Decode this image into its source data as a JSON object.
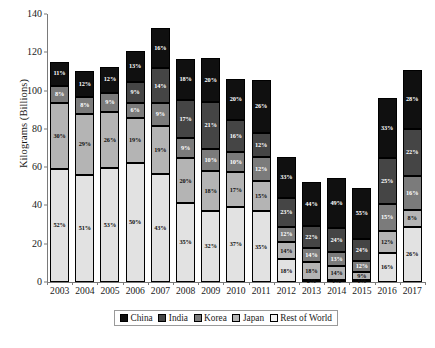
{
  "chart_data": {
    "type": "bar",
    "subtype": "stacked-bar-percent-labels",
    "title": "",
    "xlabel": "",
    "ylabel": "Kilograms (Billions)",
    "ylim": [
      0,
      140
    ],
    "yticks": [
      0,
      20,
      40,
      60,
      80,
      100,
      120,
      140
    ],
    "grid": false,
    "legend_position": "bottom",
    "categories": [
      "2003",
      "2004",
      "2005",
      "2006",
      "2007",
      "2008",
      "2009",
      "2010",
      "2011",
      "2012",
      "2013",
      "2014",
      "2015",
      "2016",
      "2017"
    ],
    "totals": [
      114,
      110,
      112.5,
      124.5,
      131.5,
      117.5,
      116,
      106,
      105.5,
      65.5,
      52,
      53.5,
      48,
      95,
      111
    ],
    "series": [
      {
        "name": "China",
        "color": "#101010",
        "percent_labels": [
          "11%",
          "12%",
          "12%",
          "13%",
          "16%",
          "18%",
          "20%",
          "20%",
          "26%",
          "33%",
          "44%",
          "49%",
          "55%",
          "33%",
          "28%"
        ]
      },
      {
        "name": "India",
        "color": "#454545",
        "percent_labels": [
          "",
          "",
          "",
          "9%",
          "14%",
          "17%",
          "21%",
          "16%",
          "12%",
          "23%",
          "22%",
          "24%",
          "24%",
          "25%",
          "22%"
        ]
      },
      {
        "name": "Korea",
        "color": "#7b7b7b",
        "percent_labels": [
          "8%",
          "8%",
          "9%",
          "6%",
          "9%",
          "9%",
          "10%",
          "10%",
          "12%",
          "12%",
          "14%",
          "13%",
          "12%",
          "15%",
          "16%"
        ]
      },
      {
        "name": "Japan",
        "color": "#b4b4b4",
        "percent_labels": [
          "30%",
          "29%",
          "26%",
          "19%",
          "19%",
          "20%",
          "18%",
          "17%",
          "15%",
          "14%",
          "18%",
          "14%",
          "9%",
          "12%",
          "8%"
        ]
      },
      {
        "name": "Rest of World",
        "color": "#f2f2f2",
        "percent_labels": [
          "52%",
          "51%",
          "53%",
          "50%",
          "43%",
          "35%",
          "32%",
          "37%",
          "35%",
          "18%",
          "2%",
          "1%",
          "1%",
          "16%",
          "26%"
        ]
      }
    ],
    "stacks": [
      {
        "year": "2003",
        "segments": [
          {
            "series": "China",
            "pct": 11
          },
          {
            "series": "India",
            "pct": 0
          },
          {
            "series": "Korea",
            "pct": 8
          },
          {
            "series": "Japan",
            "pct": 30
          },
          {
            "series": "Rest of World",
            "pct": 52
          }
        ]
      },
      {
        "year": "2004",
        "segments": [
          {
            "series": "China",
            "pct": 12
          },
          {
            "series": "India",
            "pct": 0
          },
          {
            "series": "Korea",
            "pct": 8
          },
          {
            "series": "Japan",
            "pct": 29
          },
          {
            "series": "Rest of World",
            "pct": 51
          }
        ]
      },
      {
        "year": "2005",
        "segments": [
          {
            "series": "China",
            "pct": 12
          },
          {
            "series": "India",
            "pct": 0
          },
          {
            "series": "Korea",
            "pct": 9
          },
          {
            "series": "Japan",
            "pct": 26
          },
          {
            "series": "Rest of World",
            "pct": 53
          }
        ]
      },
      {
        "year": "2006",
        "segments": [
          {
            "series": "China",
            "pct": 13
          },
          {
            "series": "India",
            "pct": 9
          },
          {
            "series": "Korea",
            "pct": 6
          },
          {
            "series": "Japan",
            "pct": 19
          },
          {
            "series": "Rest of World",
            "pct": 50
          }
        ]
      },
      {
        "year": "2007",
        "segments": [
          {
            "series": "China",
            "pct": 16
          },
          {
            "series": "India",
            "pct": 14
          },
          {
            "series": "Korea",
            "pct": 9
          },
          {
            "series": "Japan",
            "pct": 19
          },
          {
            "series": "Rest of World",
            "pct": 43
          }
        ]
      },
      {
        "year": "2008",
        "segments": [
          {
            "series": "China",
            "pct": 18
          },
          {
            "series": "India",
            "pct": 17
          },
          {
            "series": "Korea",
            "pct": 9
          },
          {
            "series": "Japan",
            "pct": 20
          },
          {
            "series": "Rest of World",
            "pct": 35
          }
        ]
      },
      {
        "year": "2009",
        "segments": [
          {
            "series": "China",
            "pct": 20
          },
          {
            "series": "India",
            "pct": 21
          },
          {
            "series": "Korea",
            "pct": 10
          },
          {
            "series": "Japan",
            "pct": 18
          },
          {
            "series": "Rest of World",
            "pct": 32
          }
        ]
      },
      {
        "year": "2010",
        "segments": [
          {
            "series": "China",
            "pct": 20
          },
          {
            "series": "India",
            "pct": 16
          },
          {
            "series": "Korea",
            "pct": 10
          },
          {
            "series": "Japan",
            "pct": 17
          },
          {
            "series": "Rest of World",
            "pct": 37
          }
        ]
      },
      {
        "year": "2011",
        "segments": [
          {
            "series": "China",
            "pct": 26
          },
          {
            "series": "India",
            "pct": 12
          },
          {
            "series": "Korea",
            "pct": 12
          },
          {
            "series": "Japan",
            "pct": 15
          },
          {
            "series": "Rest of World",
            "pct": 35
          }
        ]
      },
      {
        "year": "2012",
        "segments": [
          {
            "series": "China",
            "pct": 33
          },
          {
            "series": "India",
            "pct": 23
          },
          {
            "series": "Korea",
            "pct": 12
          },
          {
            "series": "Japan",
            "pct": 14
          },
          {
            "series": "Rest of World",
            "pct": 18
          }
        ]
      },
      {
        "year": "2013",
        "segments": [
          {
            "series": "China",
            "pct": 44
          },
          {
            "series": "India",
            "pct": 22
          },
          {
            "series": "Korea",
            "pct": 14
          },
          {
            "series": "Japan",
            "pct": 18
          },
          {
            "series": "Rest of World",
            "pct": 2
          }
        ]
      },
      {
        "year": "2014",
        "segments": [
          {
            "series": "China",
            "pct": 49
          },
          {
            "series": "India",
            "pct": 24
          },
          {
            "series": "Korea",
            "pct": 13
          },
          {
            "series": "Japan",
            "pct": 14
          },
          {
            "series": "Rest of World",
            "pct": 1
          }
        ]
      },
      {
        "year": "2015",
        "segments": [
          {
            "series": "China",
            "pct": 55
          },
          {
            "series": "India",
            "pct": 24
          },
          {
            "series": "Korea",
            "pct": 12
          },
          {
            "series": "Japan",
            "pct": 9
          },
          {
            "series": "Rest of World",
            "pct": 1
          }
        ]
      },
      {
        "year": "2016",
        "segments": [
          {
            "series": "China",
            "pct": 33
          },
          {
            "series": "India",
            "pct": 25
          },
          {
            "series": "Korea",
            "pct": 15
          },
          {
            "series": "Japan",
            "pct": 12
          },
          {
            "series": "Rest of World",
            "pct": 16
          }
        ]
      },
      {
        "year": "2017",
        "segments": [
          {
            "series": "China",
            "pct": 28
          },
          {
            "series": "India",
            "pct": 22
          },
          {
            "series": "Korea",
            "pct": 16
          },
          {
            "series": "Japan",
            "pct": 8
          },
          {
            "series": "Rest of World",
            "pct": 26
          }
        ]
      }
    ],
    "legend": [
      {
        "label": "China",
        "color": "#101010"
      },
      {
        "label": "India",
        "color": "#454545"
      },
      {
        "label": "Korea",
        "color": "#7b7b7b"
      },
      {
        "label": "Japan",
        "color": "#b4b4b4"
      },
      {
        "label": "Rest of World",
        "color": "#f2f2f2"
      }
    ]
  }
}
